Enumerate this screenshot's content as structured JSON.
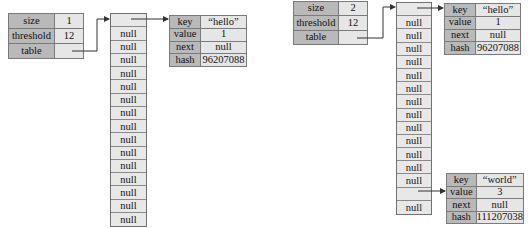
{
  "left": {
    "meta": {
      "rows": [
        {
          "label": "size",
          "value": "1"
        },
        {
          "label": "threshold",
          "value": "12"
        },
        {
          "label": "table",
          "value": ""
        }
      ]
    },
    "table_slots": [
      "",
      "null",
      "null",
      "null",
      "null",
      "null",
      "null",
      "null",
      "null",
      "null",
      "null",
      "null",
      "null",
      "null",
      "null",
      "null"
    ],
    "entries": [
      {
        "rows": [
          {
            "label": "key",
            "value": "“hello”"
          },
          {
            "label": "value",
            "value": "1"
          },
          {
            "label": "next",
            "value": "null"
          },
          {
            "label": "hash",
            "value": "96207088"
          }
        ]
      }
    ]
  },
  "right": {
    "meta": {
      "rows": [
        {
          "label": "size",
          "value": "2"
        },
        {
          "label": "threshold",
          "value": "12"
        },
        {
          "label": "table",
          "value": ""
        }
      ]
    },
    "table_slots": [
      "",
      "null",
      "null",
      "null",
      "null",
      "null",
      "null",
      "null",
      "null",
      "null",
      "null",
      "null",
      "null",
      "null",
      "",
      "null"
    ],
    "entries": [
      {
        "rows": [
          {
            "label": "key",
            "value": "“hello”"
          },
          {
            "label": "value",
            "value": "1"
          },
          {
            "label": "next",
            "value": "null"
          },
          {
            "label": "hash",
            "value": "96207088"
          }
        ]
      },
      {
        "rows": [
          {
            "label": "key",
            "value": "“world”"
          },
          {
            "label": "value",
            "value": "3"
          },
          {
            "label": "next",
            "value": "null"
          },
          {
            "label": "hash",
            "value": "111207038"
          }
        ]
      }
    ]
  },
  "colors": {
    "label_bg": "#b9b9b9",
    "value_bg": "#e6e6e6",
    "border": "#707070",
    "arrow": "#333333"
  }
}
